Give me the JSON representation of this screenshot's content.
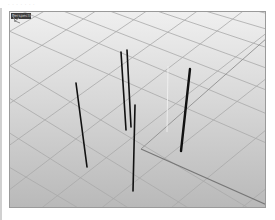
{
  "window": {
    "top_strip_text": "· · · · · · ·"
  },
  "viewport": {
    "label": "Perspective",
    "background_top": "#efefef",
    "background_bottom": "#b9b9b9",
    "grid_color": "#a8a8a8",
    "axis_color": "#7a7a7a",
    "object_color": "#111111",
    "objects": [
      {
        "name": "pole-1",
        "x1": 66,
        "y1": 71,
        "x2": 77,
        "y2": 155,
        "width": 1.6
      },
      {
        "name": "pole-2",
        "x1": 111,
        "y1": 40,
        "x2": 116,
        "y2": 118,
        "width": 1.6
      },
      {
        "name": "pole-3",
        "x1": 117,
        "y1": 38,
        "x2": 121,
        "y2": 115,
        "width": 1.6
      },
      {
        "name": "pole-4",
        "x1": 125,
        "y1": 93,
        "x2": 123,
        "y2": 179,
        "width": 1.6
      },
      {
        "name": "pole-5",
        "x1": 180,
        "y1": 57,
        "x2": 171,
        "y2": 139,
        "width": 2.4
      }
    ]
  }
}
